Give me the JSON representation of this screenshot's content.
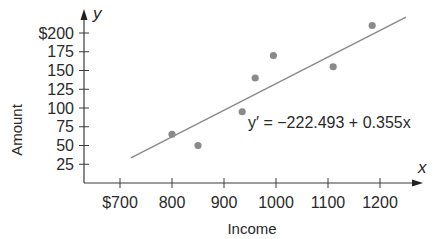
{
  "chart_data": {
    "type": "scatter",
    "title": "",
    "xlabel": "Income",
    "ylabel": "Amount",
    "x_axis_symbol": "x",
    "y_axis_symbol": "y",
    "x_ticks": [
      700,
      800,
      900,
      1000,
      1100,
      1200
    ],
    "x_tick_labels": [
      "$700",
      "800",
      "900",
      "1000",
      "1100",
      "1200"
    ],
    "y_ticks": [
      25,
      50,
      75,
      100,
      125,
      150,
      175,
      200
    ],
    "y_tick_labels": [
      "25",
      "50",
      "75",
      "100",
      "125",
      "150",
      "175",
      "$200"
    ],
    "xlim": [
      650,
      1280
    ],
    "ylim": [
      0,
      225
    ],
    "grid": false,
    "series": [
      {
        "name": "Observations",
        "points": [
          {
            "x": 800,
            "y": 65
          },
          {
            "x": 850,
            "y": 50
          },
          {
            "x": 935,
            "y": 95
          },
          {
            "x": 960,
            "y": 140
          },
          {
            "x": 995,
            "y": 170
          },
          {
            "x": 1110,
            "y": 155
          },
          {
            "x": 1185,
            "y": 210
          }
        ],
        "color": "#8a8a8a"
      }
    ],
    "regression": {
      "equation": "y′ = −222.493 + 0.355x",
      "intercept": -222.493,
      "slope": 0.355,
      "x_range": [
        721,
        1250
      ],
      "color": "#8a8a8a"
    }
  }
}
